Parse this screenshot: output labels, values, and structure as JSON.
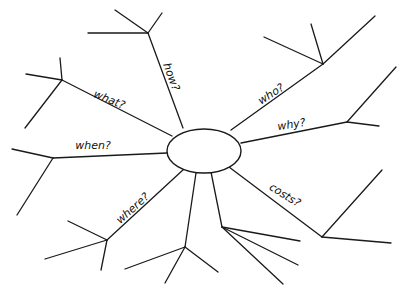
{
  "diagram": {
    "type": "spider-diagram",
    "center": {
      "label": "",
      "cx": 204,
      "cy": 151,
      "rx": 37,
      "ry": 22
    },
    "branches": [
      {
        "id": "how",
        "label": "how?",
        "start": [
          183,
          128
        ],
        "end": [
          148,
          33
        ],
        "label_pos": [
          168,
          78
        ],
        "label_angle": 70,
        "sub": [
          [
            [
              148,
              33
            ],
            [
              88,
              33
            ]
          ],
          [
            [
              148,
              33
            ],
            [
              115,
              10
            ]
          ],
          [
            [
              148,
              33
            ],
            [
              162,
              13
            ]
          ]
        ]
      },
      {
        "id": "what",
        "label": "what?",
        "start": [
          172,
          136
        ],
        "end": [
          62,
          80
        ],
        "label_pos": [
          108,
          103
        ],
        "label_angle": 22,
        "sub": [
          [
            [
              62,
              80
            ],
            [
              26,
              74
            ]
          ],
          [
            [
              62,
              80
            ],
            [
              60,
              58
            ]
          ],
          [
            [
              62,
              80
            ],
            [
              25,
              128
            ]
          ]
        ]
      },
      {
        "id": "when",
        "label": "when?",
        "start": [
          167,
          153
        ],
        "end": [
          53,
          158
        ],
        "label_pos": [
          93,
          149
        ],
        "label_angle": 0,
        "sub": [
          [
            [
              53,
              158
            ],
            [
              12,
              149
            ]
          ],
          [
            [
              53,
              158
            ],
            [
              17,
              215
            ]
          ]
        ]
      },
      {
        "id": "where",
        "label": "where?",
        "start": [
          184,
          169
        ],
        "end": [
          107,
          240
        ],
        "label_pos": [
          135,
          211
        ],
        "label_angle": -42,
        "sub": [
          [
            [
              107,
              240
            ],
            [
              68,
              221
            ]
          ],
          [
            [
              107,
              240
            ],
            [
              45,
              259
            ]
          ],
          [
            [
              107,
              240
            ],
            [
              101,
              270
            ]
          ]
        ]
      },
      {
        "id": "bottom-left",
        "label": "",
        "start": [
          196,
          173
        ],
        "end": [
          185,
          247
        ],
        "label_pos": null,
        "label_angle": 0,
        "sub": [
          [
            [
              185,
              247
            ],
            [
              125,
              269
            ]
          ],
          [
            [
              185,
              247
            ],
            [
              165,
              283
            ]
          ],
          [
            [
              185,
              247
            ],
            [
              218,
              272
            ]
          ]
        ]
      },
      {
        "id": "bottom-right",
        "label": "",
        "start": [
          211,
          172
        ],
        "end": [
          222,
          227
        ],
        "label_pos": null,
        "label_angle": 0,
        "sub": [
          [
            [
              222,
              227
            ],
            [
              300,
              241
            ]
          ],
          [
            [
              222,
              227
            ],
            [
              298,
              265
            ]
          ],
          [
            [
              222,
              227
            ],
            [
              283,
              284
            ]
          ]
        ]
      },
      {
        "id": "costs",
        "label": "costs?",
        "start": [
          229,
          167
        ],
        "end": [
          322,
          237
        ],
        "label_pos": [
          283,
          198
        ],
        "label_angle": 32,
        "sub": [
          [
            [
              322,
              237
            ],
            [
              382,
              170
            ]
          ],
          [
            [
              322,
              237
            ],
            [
              391,
              243
            ]
          ]
        ]
      },
      {
        "id": "why",
        "label": "why?",
        "start": [
          241,
          143
        ],
        "end": [
          347,
          122
        ],
        "label_pos": [
          292,
          128
        ],
        "label_angle": -9,
        "sub": [
          [
            [
              347,
              122
            ],
            [
              396,
              67
            ]
          ],
          [
            [
              347,
              122
            ],
            [
              379,
              126
            ]
          ]
        ]
      },
      {
        "id": "who",
        "label": "who?",
        "start": [
          231,
          130
        ],
        "end": [
          323,
          64
        ],
        "label_pos": [
          273,
          97
        ],
        "label_angle": -33,
        "sub": [
          [
            [
              323,
              64
            ],
            [
              375,
              16
            ]
          ],
          [
            [
              323,
              64
            ],
            [
              264,
              37
            ]
          ],
          [
            [
              323,
              64
            ],
            [
              311,
              24
            ]
          ]
        ]
      }
    ]
  }
}
